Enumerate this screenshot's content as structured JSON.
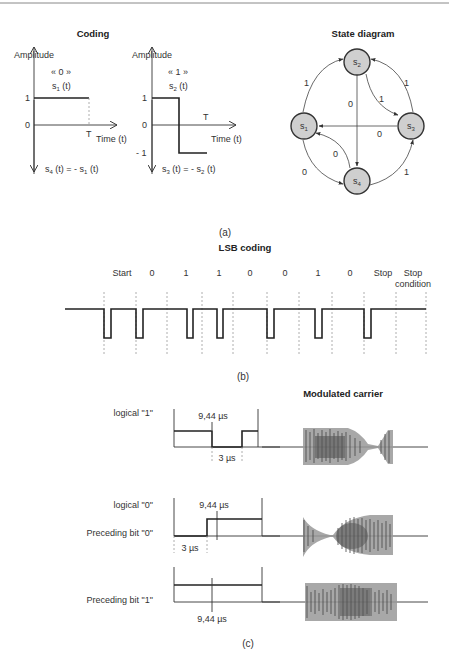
{
  "header_rule": true,
  "coding": {
    "title": "Coding",
    "plot1": {
      "ylabel": "Amplitude",
      "symbol": "« 0 »",
      "signal": "s",
      "signal_sub": "1",
      "signal_arg": " (t)",
      "y_one": "1",
      "y_zero": "0",
      "t_label": "T",
      "xlabel": "Time (t)",
      "bottom_lhs": "s",
      "bottom_lhs_sub": "4",
      "bottom_mid": " (t) = - s",
      "bottom_rhs_sub": "1",
      "bottom_end": " (t)"
    },
    "plot2": {
      "ylabel": "Amplitude",
      "symbol": "« 1 »",
      "signal": "s",
      "signal_sub": "2",
      "signal_arg": " (t)",
      "y_one": "1",
      "y_zero": "0",
      "y_minus": "- 1",
      "t_label": "T",
      "xlabel": "Time (t)",
      "bottom_lhs": "s",
      "bottom_lhs_sub": "3",
      "bottom_mid": " (t) = - s",
      "bottom_rhs_sub": "2",
      "bottom_end": " (t)"
    }
  },
  "state_diagram": {
    "title": "State diagram",
    "nodes": [
      {
        "id": "s1",
        "base": "s",
        "sub": "1"
      },
      {
        "id": "s2",
        "base": "s",
        "sub": "2"
      },
      {
        "id": "s3",
        "base": "s",
        "sub": "3"
      },
      {
        "id": "s4",
        "base": "s",
        "sub": "4"
      }
    ],
    "edges": [
      {
        "from": "s1",
        "to": "s2",
        "label": "1"
      },
      {
        "from": "s2",
        "to": "s3",
        "label": "1"
      },
      {
        "from": "s3",
        "to": "s2",
        "label": "1"
      },
      {
        "from": "s2",
        "to": "s4",
        "label": "0"
      },
      {
        "from": "s3",
        "to": "s1",
        "label": "0"
      },
      {
        "from": "s4",
        "to": "s1",
        "label": "0"
      },
      {
        "from": "s1",
        "to": "s4",
        "label": "0"
      },
      {
        "from": "s4",
        "to": "s3",
        "label": "1"
      }
    ]
  },
  "caption_a": "(a)",
  "lsb": {
    "title": "LSB coding",
    "bits": [
      "Start",
      "0",
      "1",
      "1",
      "0",
      "0",
      "1",
      "0",
      "Stop"
    ],
    "stop_condition_line1": "Stop",
    "stop_condition_line2": "condition"
  },
  "caption_b": "(b)",
  "modulation": {
    "title": "Modulated carrier",
    "row1": {
      "label": "logical \"1\"",
      "period": "9,44 µs",
      "pulse": "3 µs"
    },
    "row2": {
      "label": "logical \"0\"",
      "label2": "Preceding bit \"0\"",
      "period": "9,44 µs",
      "pulse": "3 µs"
    },
    "row3": {
      "label": "Preceding bit \"1\"",
      "period": "9,44 µs"
    }
  },
  "caption_c": "(c)"
}
